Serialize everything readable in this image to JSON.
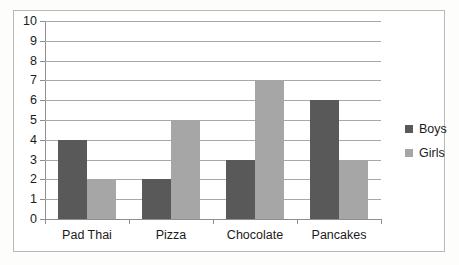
{
  "chart_data": {
    "type": "bar",
    "title": "",
    "subtitle": "",
    "xlabel": "",
    "ylabel": "",
    "categories": [
      "Pad Thai",
      "Pizza",
      "Chocolate",
      "Pancakes"
    ],
    "series": [
      {
        "name": "Boys",
        "color": "#595959",
        "values": [
          4,
          2,
          3,
          6
        ]
      },
      {
        "name": "Girls",
        "color": "#a6a6a6",
        "values": [
          2,
          5,
          7,
          3
        ]
      }
    ],
    "ylim": [
      0,
      10
    ],
    "ytick_step": 1,
    "ytick_labels": [
      "10",
      "9",
      "8",
      "7",
      "6",
      "5",
      "4",
      "3",
      "2",
      "1",
      "0"
    ],
    "grid": true,
    "grid_axis": "y",
    "legend_position": "right",
    "annotations": []
  },
  "colors": {
    "boys": "#595959",
    "girls": "#a6a6a6",
    "gridline": "#a8a8a8",
    "axis": "#8f8f8f",
    "frame": "#b9b9b9",
    "text": "#1b1b1b",
    "background": "#ffffff"
  },
  "legend": {
    "items": [
      {
        "label": "Boys"
      },
      {
        "label": "Girls"
      }
    ]
  }
}
